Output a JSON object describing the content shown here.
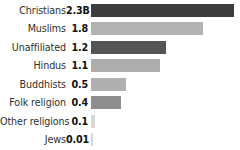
{
  "chart_data": {
    "type": "bar",
    "title": "",
    "subtitle": "",
    "xlabel": "",
    "ylabel": "",
    "orientation": "horizontal",
    "grid": false,
    "legend": false,
    "axis_visible": false,
    "units": "billions of people",
    "xlim": [
      0,
      2.3
    ],
    "categories": [
      "Christians",
      "Muslims",
      "Unaffiliated",
      "Hindus",
      "Buddhists",
      "Folk religion",
      "Other religions",
      "Jews"
    ],
    "values": [
      2.3,
      1.8,
      1.2,
      1.1,
      0.5,
      0.4,
      0.1,
      0.01
    ],
    "value_labels": [
      "2.3B",
      "1.8",
      "1.2",
      "1.1",
      "0.5",
      "0.4",
      "0.1",
      "0.01"
    ],
    "bar_colors": [
      "#3c3c3c",
      "#b3b3b3",
      "#555555",
      "#adadad",
      "#b0b0b0",
      "#8e8e8e",
      "#d8d8d8",
      "#d8d8d8"
    ],
    "rows": [
      {
        "label": "Christians",
        "value_label": "2.3B",
        "value": 2.3,
        "color": "#3c3c3c",
        "bar_width_px": 143
      },
      {
        "label": "Muslims",
        "value_label": "1.8",
        "value": 1.8,
        "color": "#b3b3b3",
        "bar_width_px": 112
      },
      {
        "label": "Unaffiliated",
        "value_label": "1.2",
        "value": 1.2,
        "color": "#555555",
        "bar_width_px": 75
      },
      {
        "label": "Hindus",
        "value_label": "1.1",
        "value": 1.1,
        "color": "#adadad",
        "bar_width_px": 69
      },
      {
        "label": "Buddhists",
        "value_label": "0.5",
        "value": 0.5,
        "color": "#b0b0b0",
        "bar_width_px": 35
      },
      {
        "label": "Folk religion",
        "value_label": "0.4",
        "value": 0.4,
        "color": "#8e8e8e",
        "bar_width_px": 30
      },
      {
        "label": "Other religions",
        "value_label": "0.1",
        "value": 0.1,
        "color": "#d8d8d8",
        "bar_width_px": 4
      },
      {
        "label": "Jews",
        "value_label": "0.01",
        "value": 0.01,
        "color": "#d8d8d8",
        "bar_width_px": 2
      }
    ]
  }
}
